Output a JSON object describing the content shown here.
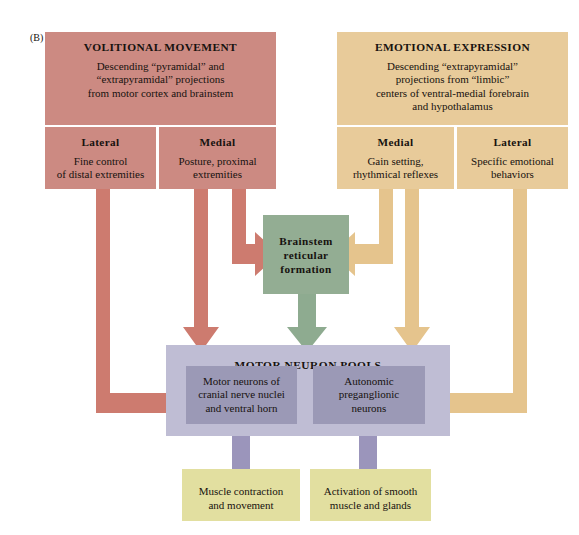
{
  "figure": {
    "panel_label": "(B)",
    "background": "#ffffff"
  },
  "colors": {
    "volitional": "#cc8a82",
    "volitional_arrow": "#cd7b6f",
    "emotional": "#e8cb9a",
    "emotional_arrow": "#e5c48d",
    "brainstem": "#93ad93",
    "brainstem_arrow": "#8eab90",
    "pools_outer": "#bfbdd4",
    "pools_inner": "#9b99b6",
    "pools_arrow": "#9b95bb",
    "output": "#e2dfa0",
    "text": "#17120f"
  },
  "volitional": {
    "title": "VOLITIONAL MOVEMENT",
    "description": "Descending “pyramidal” and “extrapyramidal” projections from motor cortex and brainstem",
    "desc_lines": [
      "Descending “pyramidal” and",
      "“extrapyramidal” projections",
      "from motor cortex and brainstem"
    ],
    "subdivisions": [
      {
        "title": "Lateral",
        "lines": [
          "Fine control",
          "of distal extremities"
        ]
      },
      {
        "title": "Medial",
        "lines": [
          "Posture, proximal",
          "extremities"
        ]
      }
    ]
  },
  "emotional": {
    "title": "EMOTIONAL EXPRESSION",
    "description": "Descending “extrapyramidal” projections from “limbic” centers of ventral-medial forebrain and hypothalamus",
    "desc_lines": [
      "Descending “extrapyramidal”",
      "projections from “limbic”",
      "centers of ventral-medial forebrain",
      "and hypothalamus"
    ],
    "subdivisions": [
      {
        "title": "Medial",
        "lines": [
          "Gain setting,",
          "rhythmical reflexes"
        ]
      },
      {
        "title": "Lateral",
        "lines": [
          "Specific emotional",
          "behaviors"
        ]
      }
    ]
  },
  "brainstem": {
    "lines": [
      "Brainstem",
      "reticular",
      "formation"
    ]
  },
  "motor_neuron_pools": {
    "title": "MOTOR NEURON POOLS",
    "pools": [
      {
        "lines": [
          "Motor neurons of",
          "cranial nerve nuclei",
          "and ventral horn"
        ]
      },
      {
        "lines": [
          "Autonomic",
          "preganglionic",
          "neurons"
        ]
      }
    ]
  },
  "outputs": [
    {
      "lines": [
        "Muscle contraction",
        "and movement"
      ]
    },
    {
      "lines": [
        "Activation of smooth",
        "muscle and glands"
      ]
    }
  ],
  "connections": [
    {
      "from": "volitional-lateral",
      "to": "motor-neuron-pools",
      "color": "#cd7b6f"
    },
    {
      "from": "volitional-medial",
      "to": "motor-neuron-pools",
      "color": "#cd7b6f"
    },
    {
      "from": "volitional-medial",
      "to": "brainstem-reticular-formation",
      "color": "#cd7b6f"
    },
    {
      "from": "emotional-medial",
      "to": "brainstem-reticular-formation",
      "color": "#e5c48d"
    },
    {
      "from": "emotional-medial",
      "to": "motor-neuron-pools",
      "color": "#e5c48d"
    },
    {
      "from": "emotional-lateral",
      "to": "motor-neuron-pools",
      "color": "#e5c48d"
    },
    {
      "from": "brainstem-reticular-formation",
      "to": "motor-neuron-pools",
      "color": "#8eab90"
    },
    {
      "from": "motor-neurons-cranial",
      "to": "muscle-contraction",
      "color": "#9b95bb"
    },
    {
      "from": "autonomic-preganglionic",
      "to": "smooth-muscle-activation",
      "color": "#9b95bb"
    }
  ]
}
